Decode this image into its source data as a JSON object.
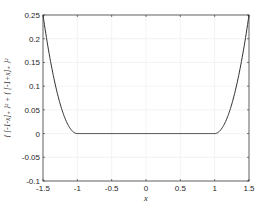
{
  "chart_data": {
    "type": "line",
    "title": "",
    "xlabel": "x",
    "ylabel": "{ [-1-x]_+ }^2 + { [-1+x]_+ }^2",
    "ylabel_display": "{ [-1-x]₊ }² + { [-1+x]₊ }²",
    "xlim": [
      -1.5,
      1.5
    ],
    "ylim": [
      -0.1,
      0.25
    ],
    "xticks": [
      -1.5,
      -1,
      -0.5,
      0,
      0.5,
      1,
      1.5
    ],
    "xtick_labels": [
      "-1.5",
      "-1",
      "-0.5",
      "0",
      "0.5",
      "1",
      "1.5"
    ],
    "yticks": [
      -0.1,
      -0.05,
      0,
      0.05,
      0.1,
      0.15,
      0.2,
      0.25
    ],
    "ytick_labels": [
      "-0.1",
      "-0.05",
      "0",
      "0.05",
      "0.1",
      "0.15",
      "0.2",
      "0.25"
    ],
    "grid": true,
    "legend": null,
    "series": [
      {
        "name": "f(x)",
        "color": "#333333",
        "x": [
          -1.5,
          -1.4,
          -1.3,
          -1.2,
          -1.1,
          -1.0,
          -0.5,
          0,
          0.5,
          1.0,
          1.1,
          1.2,
          1.3,
          1.4,
          1.5
        ],
        "y": [
          0.25,
          0.16,
          0.09,
          0.04,
          0.01,
          0,
          0,
          0,
          0,
          0,
          0.01,
          0.04,
          0.09,
          0.16,
          0.25
        ]
      }
    ]
  },
  "layout": {
    "plot_left": 43,
    "plot_right": 249,
    "plot_top": 15,
    "plot_bottom": 181,
    "grid_color": "#ebebeb",
    "axis_color": "#262626",
    "line_color": "#333333"
  }
}
